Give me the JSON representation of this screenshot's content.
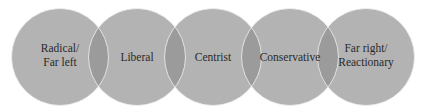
{
  "diagram": {
    "type": "overlapping-circles-spectrum",
    "colors": {
      "circle_fill": "#b3b3b3",
      "overlap_fill": "#9b9b9b",
      "outline": "#f2f2f2",
      "text": "#2a2a2a",
      "background": "#ffffff"
    },
    "circles": [
      {
        "id": "radical",
        "lines": [
          "Radical/",
          "Far left"
        ]
      },
      {
        "id": "liberal",
        "lines": [
          "Liberal"
        ]
      },
      {
        "id": "centrist",
        "lines": [
          "Centrist"
        ]
      },
      {
        "id": "conservative",
        "lines": [
          "Conservative"
        ]
      },
      {
        "id": "far-right",
        "lines": [
          "Far right/",
          "Reactionary"
        ]
      }
    ]
  }
}
